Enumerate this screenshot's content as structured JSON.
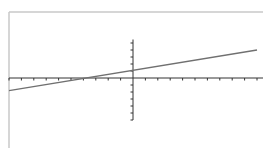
{
  "header": {
    "text": ""
  },
  "colors": {
    "frame": "#c8c8c8",
    "axis": "#333333",
    "line": "#707070",
    "background": "#ffffff"
  },
  "chart_data": {
    "type": "line",
    "title": "",
    "xlabel": "",
    "ylabel": "",
    "grid": false,
    "legend": null,
    "xlim": [
      -10,
      10.5
    ],
    "ylim": [
      -6,
      5.5
    ],
    "x_tick_step": 1,
    "y_tick_step": 1,
    "series": [
      {
        "name": "line",
        "equation": "y = 0.3x + 1.9",
        "x": [
          -10,
          10
        ],
        "y": [
          -1.8,
          4.0
        ]
      }
    ],
    "layout": {
      "frame": {
        "x": 9,
        "y": 12,
        "w": 254,
        "h": 136
      },
      "origin_px": {
        "x": 133,
        "y": 78
      },
      "unit_px": {
        "x": 12.4,
        "y": 7.0
      }
    }
  }
}
